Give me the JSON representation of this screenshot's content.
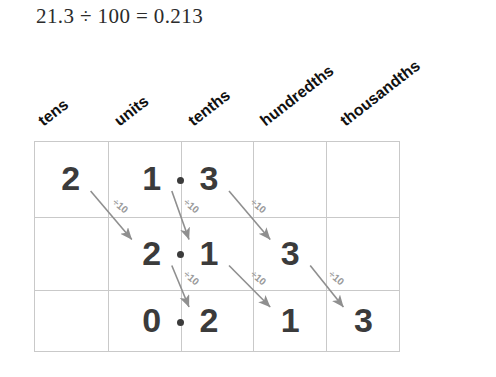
{
  "equation": {
    "text": "21.3 ÷ 100 = 0.213",
    "dividend": "21.3",
    "divisor": "100",
    "quotient": "0.213"
  },
  "columns": [
    {
      "label": "tens",
      "place": "tens"
    },
    {
      "label": "units",
      "place": "units"
    },
    {
      "label": "tenths",
      "place": "tenths"
    },
    {
      "label": "hundredths",
      "place": "hundredths"
    },
    {
      "label": "thousandths",
      "place": "thousandths"
    }
  ],
  "rows": [
    {
      "name": "row-start",
      "value": "21.3",
      "cells": [
        "2",
        "1",
        "3",
        "",
        ""
      ],
      "decimal_after_column": 1
    },
    {
      "name": "row-after-first-divide",
      "value": "2.13",
      "cells": [
        "",
        "2",
        "1",
        "3",
        ""
      ],
      "decimal_after_column": 1
    },
    {
      "name": "row-after-second-divide",
      "value": "0.213",
      "cells": [
        "",
        "0",
        "2",
        "1",
        "3"
      ],
      "decimal_after_column": 1
    }
  ],
  "arrows": [
    {
      "label": "÷10",
      "from_row": 0,
      "from_col": 0,
      "to_row": 1,
      "to_col": 1
    },
    {
      "label": "÷10",
      "from_row": 0,
      "from_col": 1,
      "to_row": 1,
      "to_col": 2
    },
    {
      "label": "÷10",
      "from_row": 0,
      "from_col": 2,
      "to_row": 1,
      "to_col": 3
    },
    {
      "label": "÷10",
      "from_row": 1,
      "from_col": 1,
      "to_row": 2,
      "to_col": 2
    },
    {
      "label": "÷10",
      "from_row": 1,
      "from_col": 2,
      "to_row": 2,
      "to_col": 3
    },
    {
      "label": "÷10",
      "from_row": 1,
      "from_col": 3,
      "to_row": 2,
      "to_col": 4
    }
  ],
  "colors": {
    "digit": "#3b3b3b",
    "grid_line": "#c9c9c9",
    "arrow": "#8f8f8f",
    "arrow_label": "#9a9a9a",
    "header_text": "#111111",
    "equation_text": "#2b2b2b",
    "background": "#ffffff"
  }
}
